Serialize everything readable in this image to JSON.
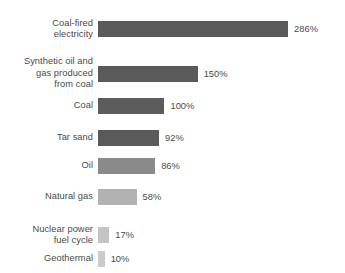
{
  "chart_data": {
    "type": "bar",
    "orientation": "horizontal",
    "title": "",
    "subtitle": "",
    "xlabel": "",
    "ylabel": "",
    "grid": false,
    "legend": false,
    "axis_visible": false,
    "xlim": [
      0,
      286
    ],
    "unit": "%",
    "categories": [
      "Coal-fired\nelectricity",
      "Synthetic oil and\ngas produced\nfrom coal",
      "Coal",
      "Tar sand",
      "Oil",
      "Natural gas",
      "Nuclear power\nfuel cycle",
      "Geothermal"
    ],
    "values": [
      286,
      150,
      100,
      92,
      86,
      58,
      17,
      10
    ],
    "value_labels": [
      "286%",
      "150%",
      "100%",
      "92%",
      "86%",
      "58%",
      "17%",
      "10%"
    ],
    "bar_colors": [
      "#5a5a5a",
      "#5a5a5a",
      "#5c5c5c",
      "#5a5a5a",
      "#8a8a8a",
      "#b2b2b2",
      "#c4c4c4",
      "#cacaca"
    ]
  },
  "colors": {
    "background": "#ffffff",
    "text": "#4a4a4a"
  }
}
